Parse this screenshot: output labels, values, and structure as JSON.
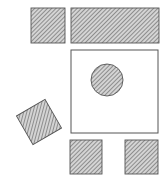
{
  "diagram": {
    "width": 166,
    "height": 188,
    "background": "#ffffff",
    "stroke_color": "#555555",
    "hatch_color": "#7a7a7a",
    "hatch_bg": "#d9d9d9",
    "shapes": [
      {
        "id": "top-left-square",
        "type": "rect",
        "x": 31,
        "y": 8,
        "w": 34,
        "h": 35,
        "fill": "hatched"
      },
      {
        "id": "top-wide-rect",
        "type": "rect",
        "x": 71,
        "y": 8,
        "w": 88,
        "h": 35,
        "fill": "hatched"
      },
      {
        "id": "open-square",
        "type": "rect",
        "x": 71,
        "y": 50,
        "w": 87,
        "h": 83,
        "fill": "none"
      },
      {
        "id": "center-circle",
        "type": "circle",
        "cx": 107,
        "cy": 80,
        "r": 16,
        "fill": "hatched"
      },
      {
        "id": "rotated-square",
        "type": "rect",
        "x": 22.5,
        "y": 105.5,
        "w": 33,
        "h": 33,
        "rotate": -30,
        "cx": 39,
        "cy": 122,
        "fill": "hatched"
      },
      {
        "id": "bottom-left-square",
        "type": "rect",
        "x": 70,
        "y": 140,
        "w": 32,
        "h": 34,
        "fill": "hatched"
      },
      {
        "id": "bottom-right-square",
        "type": "rect",
        "x": 125,
        "y": 140,
        "w": 33,
        "h": 34,
        "fill": "hatched"
      }
    ]
  }
}
